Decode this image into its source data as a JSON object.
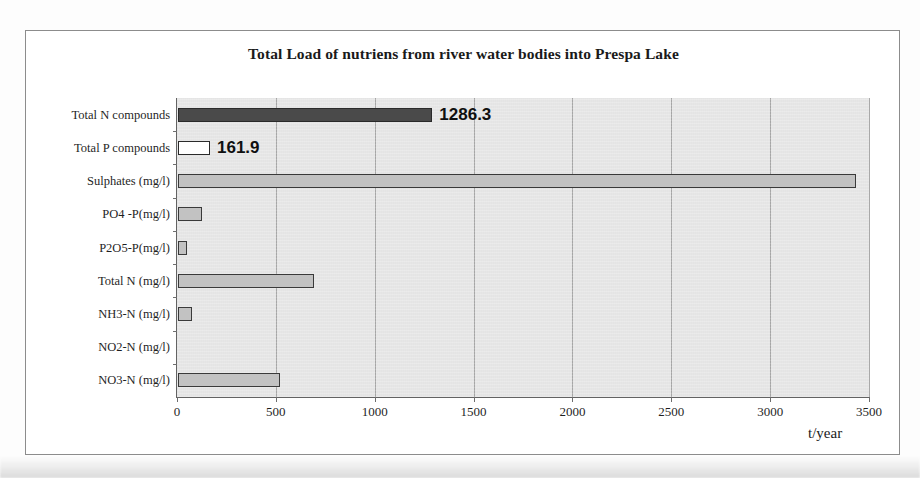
{
  "chart_data": {
    "type": "bar",
    "orientation": "horizontal",
    "title": "Total Load of nutriens from river water bodies into Prespa Lake",
    "xlabel": "t/year",
    "ylabel": "",
    "xlim": [
      0,
      3500
    ],
    "xticks": [
      0,
      500,
      1000,
      1500,
      2000,
      2500,
      3000,
      3500
    ],
    "xtick_labels": [
      "0",
      "500",
      "1000",
      "1500",
      "2000",
      "2500",
      "3000",
      "3500"
    ],
    "grid": "vertical",
    "legend": "none",
    "categories": [
      "Total N compounds",
      "Total P compounds",
      "Sulphates (mg/l)",
      "PO4 -P(mg/l)",
      "P2O5-P(mg/l)",
      "Total N (mg/l)",
      "NH3-N (mg/l)",
      "NO2-N (mg/l)",
      "NO3-N (mg/l)"
    ],
    "values": [
      1286.3,
      161.9,
      3430,
      120,
      45,
      690,
      70,
      0,
      515
    ],
    "data_labels": [
      "1286.3",
      "161.9",
      "",
      "",
      "",
      "",
      "",
      "",
      ""
    ],
    "bar_styles": [
      "dark",
      "white",
      "gray",
      "gray",
      "gray",
      "gray",
      "gray",
      "gray",
      "gray"
    ],
    "colors": {
      "bar_dark": "#4a4a4a",
      "bar_white": "#ffffff",
      "bar_gray": "#c2c2c2",
      "bar_outline": "#2b2b2b",
      "plot_background": "#e9e9e9",
      "gridline": "#a9a9a9",
      "axis": "#636363",
      "frame": "#8c8c8c",
      "text": "#1a1a1a"
    }
  }
}
